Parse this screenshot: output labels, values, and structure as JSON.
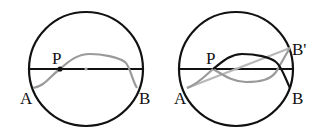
{
  "colors": {
    "circle": "#111111",
    "diameter": "#111111",
    "gray_path": "#9a9a9a",
    "light_path": "#b8b8b8",
    "background": "#ffffff"
  },
  "figures": [
    {
      "id": "left",
      "labels": {
        "p": "P",
        "a": "A",
        "b": "B"
      }
    },
    {
      "id": "right",
      "labels": {
        "p": "P",
        "a": "A",
        "b": "B",
        "b_prime": "B'"
      }
    }
  ]
}
